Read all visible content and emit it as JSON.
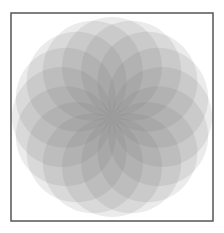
{
  "figure": {
    "width": 224,
    "height": 233,
    "background": "#ffffff",
    "frame": {
      "x": 11,
      "y": 13,
      "width": 202,
      "height": 208,
      "stroke": "#555555",
      "stroke_width": 1.5
    },
    "rosette": {
      "center_x": 112,
      "center_y": 117,
      "circle_count": 16,
      "circle_radius": 50,
      "ring_radius": 50,
      "fill": "#6e6e6e",
      "fill_opacity": 0.14
    }
  }
}
